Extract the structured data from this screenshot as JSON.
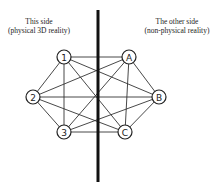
{
  "labels": {
    "left_title": "This side",
    "left_subtitle": "(physical 3D reality)",
    "right_title": "The other side",
    "right_subtitle": "(non-physical reality)"
  },
  "divider": {
    "x": 98,
    "y1": 10,
    "y2": 182
  },
  "nodes": [
    {
      "id": "1",
      "label": "1",
      "x": 64,
      "y": 57,
      "side": "left"
    },
    {
      "id": "2",
      "label": "2",
      "x": 33,
      "y": 97,
      "side": "left"
    },
    {
      "id": "3",
      "label": "3",
      "x": 64,
      "y": 132,
      "side": "left"
    },
    {
      "id": "A",
      "label": "A",
      "x": 129,
      "y": 57,
      "side": "right"
    },
    {
      "id": "B",
      "label": "B",
      "x": 159,
      "y": 97,
      "side": "right"
    },
    {
      "id": "C",
      "label": "C",
      "x": 125,
      "y": 132,
      "side": "right"
    }
  ],
  "edges": [
    [
      "1",
      "2"
    ],
    [
      "1",
      "3"
    ],
    [
      "1",
      "A"
    ],
    [
      "1",
      "B"
    ],
    [
      "1",
      "C"
    ],
    [
      "2",
      "3"
    ],
    [
      "2",
      "A"
    ],
    [
      "2",
      "B"
    ],
    [
      "2",
      "C"
    ],
    [
      "3",
      "A"
    ],
    [
      "3",
      "B"
    ],
    [
      "3",
      "C"
    ],
    [
      "A",
      "B"
    ],
    [
      "A",
      "C"
    ],
    [
      "B",
      "C"
    ]
  ],
  "node_radius": 7
}
